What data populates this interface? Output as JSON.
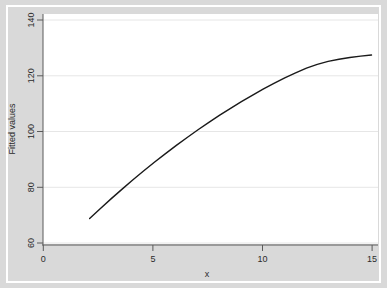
{
  "figure": {
    "background_color": "#d9d9d9",
    "plot_background_color": "#ffffff",
    "border_color": "#ffffff"
  },
  "chart_data": {
    "type": "line",
    "title": "",
    "subtitle": "",
    "xlabel": "x",
    "ylabel": "Fitted values",
    "xlim": [
      -0.15,
      15.3
    ],
    "ylim": [
      56.8,
      144
    ],
    "xticks": [
      0,
      5,
      10,
      15
    ],
    "xtick_labels": [
      "0",
      "5",
      "10",
      "15"
    ],
    "yticks": [
      60,
      80,
      100,
      120,
      140
    ],
    "ytick_labels": [
      "60",
      "80",
      "100",
      "120",
      "140"
    ],
    "grid": "horizontal",
    "grid_color": "#e8e8e8",
    "legend": "none",
    "series": [
      {
        "name": "Fitted values",
        "color": "#1a1a1a",
        "line_width": 1.4,
        "x": [
          2.0,
          2.5,
          3.0,
          3.5,
          4.0,
          4.5,
          5.0,
          5.5,
          6.0,
          6.5,
          7.0,
          7.5,
          8.0,
          8.5,
          9.0,
          9.5,
          10.0,
          10.5,
          11.0,
          11.5,
          12.0,
          12.5,
          13.0,
          13.5,
          14.0,
          14.5,
          15.0
        ],
        "y": [
          66.8,
          70.6,
          74.3,
          77.9,
          81.4,
          84.8,
          88.1,
          91.3,
          94.4,
          97.4,
          100.3,
          103.1,
          105.8,
          108.4,
          110.9,
          113.3,
          115.6,
          117.8,
          119.9,
          121.8,
          123.6,
          125.0,
          126.1,
          126.9,
          127.6,
          128.1,
          128.5
        ]
      }
    ]
  },
  "axis_ticks": {
    "x_tick_color": "#4d4d4d",
    "y_tick_color": "#4d4d4d"
  }
}
